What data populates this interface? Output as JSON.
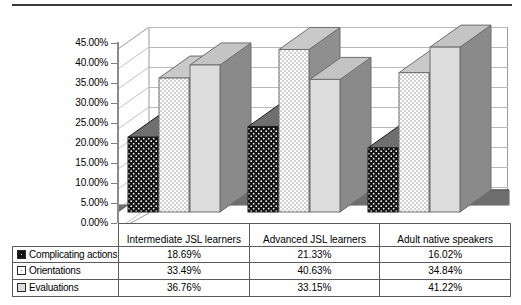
{
  "chart_data": {
    "type": "bar",
    "title": "",
    "subtitle": "",
    "xlabel": "",
    "ylabel": "",
    "ylim": [
      0,
      45
    ],
    "grid": true,
    "legend_position": "bottom-table",
    "three_d": true,
    "categories": [
      "Intermediate JSL learners",
      "Advanced JSL learners",
      "Adult native speakers"
    ],
    "series": [
      {
        "name": "Complicating actions",
        "values": [
          18.69,
          21.33,
          16.02
        ],
        "labels": [
          "18.69%",
          "21.33%",
          "16.02%"
        ],
        "swatch": "black-dotted",
        "color": "#121212"
      },
      {
        "name": "Orientations",
        "values": [
          33.49,
          40.63,
          34.84
        ],
        "labels": [
          "33.49%",
          "40.63%",
          "34.84%"
        ],
        "swatch": "white-dotted",
        "color": "#ffffff"
      },
      {
        "name": "Evaluations",
        "values": [
          36.76,
          33.15,
          41.22
        ],
        "labels": [
          "36.76%",
          "33.15%",
          "41.22%"
        ],
        "swatch": "light-gray-solid",
        "color": "#dcdcdc"
      }
    ],
    "ytick_labels": [
      "45.00%",
      "40.00%",
      "35.00%",
      "30.00%",
      "25.00%",
      "20.00%",
      "15.00%",
      "10.00%",
      "5.00%",
      "0.00%"
    ],
    "ytick_values": [
      45,
      40,
      35,
      30,
      25,
      20,
      15,
      10,
      5,
      0
    ]
  },
  "table": {
    "rows": [
      {
        "series": "Complicating actions",
        "cells": [
          "18.69%",
          "21.33%",
          "16.02%"
        ]
      },
      {
        "series": "Orientations",
        "cells": [
          "33.49%",
          "40.63%",
          "34.84%"
        ]
      },
      {
        "series": "Evaluations",
        "cells": [
          "36.76%",
          "33.15%",
          "41.22%"
        ]
      }
    ]
  }
}
